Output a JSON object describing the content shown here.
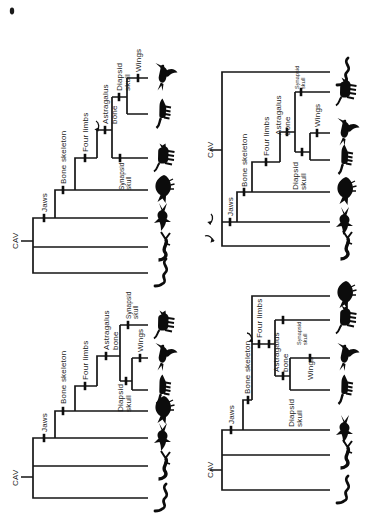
{
  "figure": {
    "root_label": "CAV",
    "characters": [
      "Jaws",
      "Bone skeleton",
      "Four limbs",
      "Astragalus bone",
      "Synapsid skull",
      "Diapsid skull",
      "Wings"
    ],
    "taxa": [
      "hagfish",
      "lamprey",
      "shark",
      "perch",
      "cat",
      "crocodile",
      "bird"
    ],
    "panels": [
      {
        "id": "top-left",
        "tips_bottom_to_top": [
          "hagfish",
          "lamprey",
          "shark",
          "perch",
          "cat",
          "crocodile",
          "bird"
        ],
        "rotation_arrows": 1,
        "rotation_arrow_at": "astragalus-bone node"
      },
      {
        "id": "top-right",
        "tips_bottom_to_top": [
          "lamprey",
          "shark",
          "perch",
          "crocodile",
          "bird",
          "cat",
          "hagfish"
        ],
        "rotation_arrows": 2,
        "rotation_arrow_at": "root jaws node"
      },
      {
        "id": "bottom-left",
        "tips_bottom_to_top": [
          "hagfish",
          "lamprey",
          "shark",
          "perch",
          "crocodile",
          "bird",
          "cat"
        ],
        "rotation_arrows": 0,
        "rotation_arrow_at": null
      },
      {
        "id": "bottom-right",
        "tips_bottom_to_top": [
          "hagfish",
          "lamprey",
          "shark",
          "crocodile",
          "bird",
          "cat",
          "perch"
        ],
        "rotation_arrows": 1,
        "rotation_arrow_at": "four-limbs node"
      }
    ],
    "colors": {
      "ink": "#111111",
      "paper": "#ffffff"
    }
  },
  "labels": {
    "root": "CAV",
    "jaws": "Jaws",
    "bone_skeleton": "Bone skeleton",
    "four_limbs": "Four limbs",
    "astragalus": "Astragalus",
    "bone": "bone",
    "synapsid": "Synapsid",
    "diapsid": "Diapsid",
    "skull": "skull",
    "wings": "Wings"
  }
}
